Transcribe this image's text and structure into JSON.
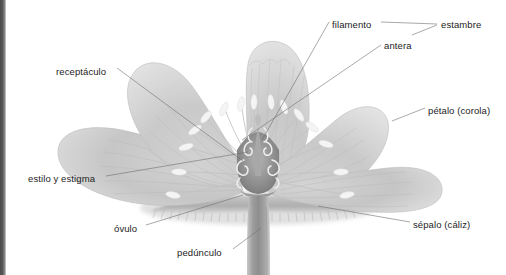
{
  "figure": {
    "language": "es",
    "style": "grayscale botanical illustration",
    "background_color": "#ffffff",
    "label_color": "#1d1d1d",
    "leader_color": "#6f6f6f",
    "page_edge_color": "#4b4b4b"
  },
  "labels": {
    "receptaculo": "receptáculo",
    "estilo_estigma": "estilo y estigma",
    "ovulo": "óvulo",
    "pedunculo": "pedúnculo",
    "filamento": "filamento",
    "antera": "antera",
    "estambre": "estambre",
    "petalo": "pétalo (corola)",
    "sepalo": "sépalo (cáliz)"
  },
  "parts": [
    {
      "id": "receptaculo",
      "label": "receptáculo",
      "side": "left",
      "label_x": 56,
      "label_y": 66,
      "target_x": 243,
      "target_y": 161
    },
    {
      "id": "estilo_estigma",
      "label": "estilo y estigma",
      "side": "left",
      "label_x": 28,
      "label_y": 173,
      "target_x": 247,
      "target_y": 150
    },
    {
      "id": "ovulo",
      "label": "óvulo",
      "side": "left",
      "label_x": 114,
      "label_y": 223,
      "target_x": 243,
      "target_y": 194
    },
    {
      "id": "pedunculo",
      "label": "pedúnculo",
      "side": "left",
      "label_x": 177,
      "label_y": 247,
      "target_x": 262,
      "target_y": 228
    },
    {
      "id": "filamento",
      "label": "filamento",
      "side": "top",
      "label_x": 332,
      "label_y": 19,
      "target_x": 262,
      "target_y": 139
    },
    {
      "id": "antera",
      "label": "antera",
      "side": "top",
      "label_x": 384,
      "label_y": 40,
      "target_x": 243,
      "target_y": 139
    },
    {
      "id": "estambre",
      "label": "estambre",
      "side": "right",
      "label_x": 441,
      "label_y": 19,
      "target_x": 417,
      "target_y": 24
    },
    {
      "id": "petalo",
      "label": "pétalo (corola)",
      "side": "right",
      "label_x": 428,
      "label_y": 105,
      "target_x": 392,
      "target_y": 120
    },
    {
      "id": "sepalo",
      "label": "sépalo (cáliz)",
      "side": "right",
      "label_x": 413,
      "label_y": 219,
      "target_x": 318,
      "target_y": 205
    }
  ],
  "anatomy": {
    "petal_count_visible": 5,
    "stamen_count_visible": 22,
    "pistil": "estilo y estigma sobre el ovario con óvulos",
    "stem": "pedúnculo"
  }
}
